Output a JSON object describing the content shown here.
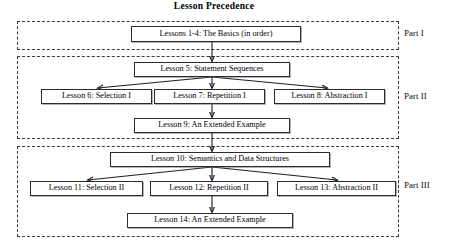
{
  "diagram": {
    "title": "Lesson Precedence",
    "type": "flowchart",
    "parts": [
      {
        "id": "part-1",
        "label": "Part I",
        "zone": {
          "x": 17,
          "y": 21,
          "w": 382,
          "h": 29
        },
        "label_pos": {
          "x": 404,
          "y": 31
        }
      },
      {
        "id": "part-2",
        "label": "Part II",
        "zone": {
          "x": 17,
          "y": 56,
          "w": 382,
          "h": 83
        },
        "label_pos": {
          "x": 404,
          "y": 95
        }
      },
      {
        "id": "part-3",
        "label": "Part III",
        "zone": {
          "x": 17,
          "y": 146,
          "w": 382,
          "h": 91
        },
        "label_pos": {
          "x": 404,
          "y": 184
        }
      }
    ],
    "nodes": [
      {
        "id": "lessons-1-4",
        "label": "Lessons 1-4: The Basics (in order)",
        "x": 131,
        "y": 26,
        "w": 170,
        "h": 16,
        "part": "part-1"
      },
      {
        "id": "lesson-5",
        "label": "Lesson 5: Statement Sequences",
        "x": 134,
        "y": 62,
        "w": 156,
        "h": 15,
        "part": "part-2"
      },
      {
        "id": "lesson-6",
        "label": "Lesson 6: Selection I",
        "x": 41,
        "y": 89,
        "w": 111,
        "h": 15,
        "part": "part-2"
      },
      {
        "id": "lesson-7",
        "label": "Lesson 7: Repetition I",
        "x": 154,
        "y": 89,
        "w": 111,
        "h": 15,
        "part": "part-2"
      },
      {
        "id": "lesson-8",
        "label": "Lesson 8: Abstraction I",
        "x": 274,
        "y": 89,
        "w": 111,
        "h": 15,
        "part": "part-2"
      },
      {
        "id": "lesson-9",
        "label": "Lesson 9: An Extended Example",
        "x": 134,
        "y": 118,
        "w": 156,
        "h": 15,
        "part": "part-2"
      },
      {
        "id": "lesson-10",
        "label": "Lesson 10: Semantics and Data Structures",
        "x": 110,
        "y": 152,
        "w": 220,
        "h": 15,
        "part": "part-3"
      },
      {
        "id": "lesson-11",
        "label": "Lesson 11: Selection II",
        "x": 30,
        "y": 181,
        "w": 113,
        "h": 15,
        "part": "part-3"
      },
      {
        "id": "lesson-12",
        "label": "Lesson 12: Repetition II",
        "x": 150,
        "y": 181,
        "w": 118,
        "h": 15,
        "part": "part-3"
      },
      {
        "id": "lesson-13",
        "label": "Lesson 13: Abstraction II",
        "x": 277,
        "y": 181,
        "w": 119,
        "h": 15,
        "part": "part-3"
      },
      {
        "id": "lesson-14",
        "label": "Lesson 14: An Extended Example",
        "x": 127,
        "y": 213,
        "w": 166,
        "h": 15,
        "part": "part-3"
      }
    ],
    "edges": [
      {
        "from": "lessons-1-4",
        "to": "lesson-5",
        "kind": "vertical"
      },
      {
        "from": "lesson-5",
        "to": "lesson-6",
        "kind": "diagonal-left"
      },
      {
        "from": "lesson-5",
        "to": "lesson-7",
        "kind": "vertical"
      },
      {
        "from": "lesson-5",
        "to": "lesson-8",
        "kind": "diagonal-right"
      },
      {
        "from": "lesson-7",
        "to": "lesson-9",
        "kind": "vertical"
      },
      {
        "from": "lesson-9",
        "to": "lesson-10",
        "kind": "vertical"
      },
      {
        "from": "lesson-10",
        "to": "lesson-11",
        "kind": "diagonal-left"
      },
      {
        "from": "lesson-10",
        "to": "lesson-12",
        "kind": "vertical"
      },
      {
        "from": "lesson-10",
        "to": "lesson-13",
        "kind": "diagonal-right"
      },
      {
        "from": "lesson-12",
        "to": "lesson-14",
        "kind": "vertical"
      }
    ],
    "colors": {
      "box_border": "#2b2b2b",
      "zone_border": "#3a3a3a",
      "edge": "#1d1d1d",
      "text": "#000000",
      "background": "#ffffff"
    }
  }
}
